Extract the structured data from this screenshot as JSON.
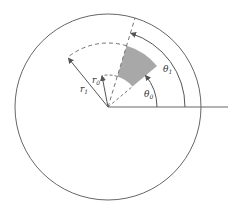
{
  "diagram": {
    "center": [
      108,
      107
    ],
    "circle_radius": 93,
    "colors": {
      "stroke": "#555555",
      "sector_fill": "#a8a8a8",
      "background": "#ffffff"
    },
    "sector": {
      "r_inner": 32,
      "r_outer": 64,
      "theta_start_deg": 40,
      "theta_end_deg": 73
    },
    "labels": {
      "r1": {
        "base": "r",
        "sub": "1"
      },
      "r0": {
        "base": "r",
        "sub": "0"
      },
      "theta1": {
        "base": "θ",
        "sub": "1"
      },
      "theta0": {
        "base": "θ",
        "sub": "0"
      }
    }
  }
}
